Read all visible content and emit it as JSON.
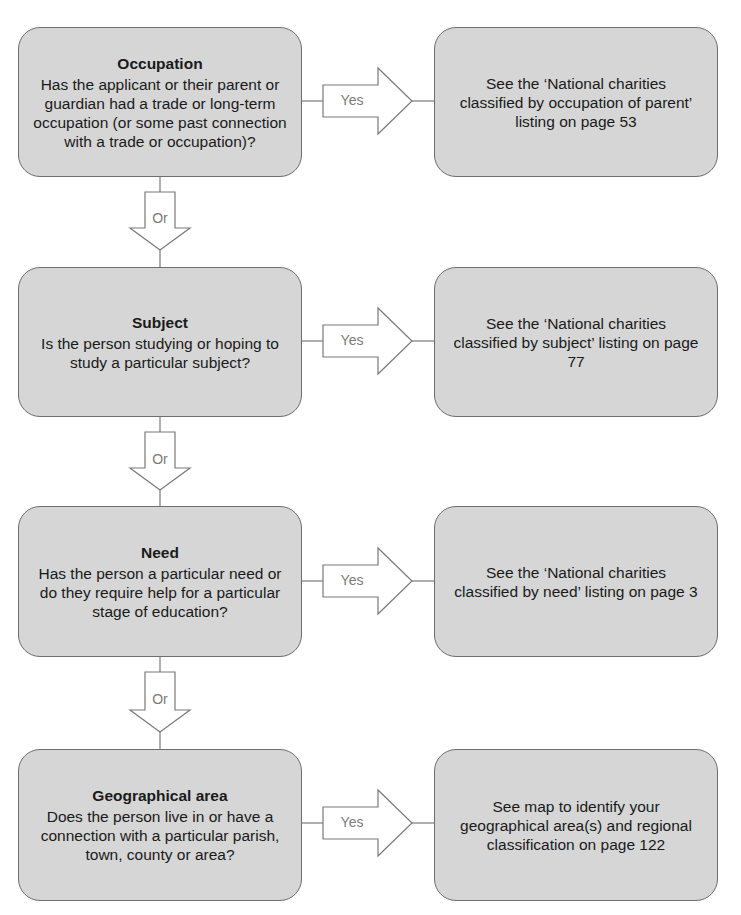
{
  "flowchart": {
    "rows": [
      {
        "question_title": "Occupation",
        "question_text": "Has the applicant or their parent or guardian had a trade or long-term occupation (or some past connection with a trade or occupation)?",
        "yes_label": "Yes",
        "result_text": "See the ‘National charities classified by occupation of parent’ listing on page 53",
        "or_label": "Or"
      },
      {
        "question_title": "Subject",
        "question_text": "Is the person studying or hoping to study a particular subject?",
        "yes_label": "Yes",
        "result_text": "See the ‘National charities classified by subject’ listing on page 77",
        "or_label": "Or"
      },
      {
        "question_title": "Need",
        "question_text": "Has the person a particular need or do they require help for a particular stage of education?",
        "yes_label": "Yes",
        "result_text": "See the ‘National charities classified by need’ listing on page 3",
        "or_label": "Or"
      },
      {
        "question_title": "Geographical area",
        "question_text": "Does the person live in or have a connection with a particular parish, town, county or area?",
        "yes_label": "Yes",
        "result_text": "See map to identify your geographical area(s) and regional classification on page 122"
      }
    ],
    "colors": {
      "box_fill": "#d6d6d6",
      "box_border": "#6e6e6e",
      "arrow_stroke": "#7a7a7a",
      "arrow_label": "#7a7a7a"
    }
  }
}
